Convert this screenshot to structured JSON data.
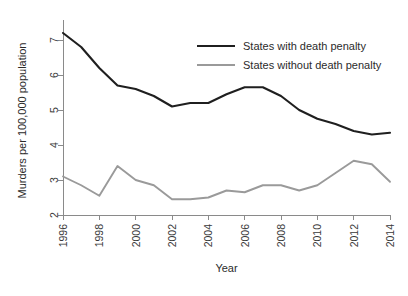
{
  "chart_data": {
    "type": "line",
    "title": "",
    "xlabel": "Year",
    "ylabel": "Murders per 100,000 population",
    "xlim": [
      1996,
      2014
    ],
    "ylim": [
      2,
      7.4
    ],
    "grid": false,
    "legend_position": "top-right",
    "x": [
      1996,
      1997,
      1998,
      1999,
      2000,
      2001,
      2002,
      2003,
      2004,
      2005,
      2006,
      2007,
      2008,
      2009,
      2010,
      2011,
      2012,
      2013,
      2014
    ],
    "xticks": [
      "1996",
      "1998",
      "2000",
      "2002",
      "2004",
      "2006",
      "2008",
      "2010",
      "2012",
      "2014"
    ],
    "xtick_values": [
      1996,
      1998,
      2000,
      2002,
      2004,
      2006,
      2008,
      2010,
      2012,
      2014
    ],
    "yticks": [
      "2",
      "3",
      "4",
      "5",
      "6",
      "7"
    ],
    "ytick_values": [
      2,
      3,
      4,
      5,
      6,
      7
    ],
    "series": [
      {
        "name": "States with death penalty",
        "color": "#1f1f1f",
        "width": 2.1,
        "values": [
          7.2,
          6.8,
          6.2,
          5.7,
          5.6,
          5.4,
          5.1,
          5.2,
          5.2,
          5.45,
          5.65,
          5.65,
          5.4,
          5.0,
          4.75,
          4.6,
          4.4,
          4.3,
          4.35
        ]
      },
      {
        "name": "States without death penalty",
        "color": "#9a9a9a",
        "width": 1.9,
        "values": [
          3.1,
          2.85,
          2.55,
          3.4,
          3.0,
          2.85,
          2.45,
          2.45,
          2.5,
          2.7,
          2.65,
          2.85,
          2.85,
          2.7,
          2.85,
          3.2,
          3.55,
          3.45,
          2.95
        ]
      }
    ]
  },
  "legend": {
    "entries": [
      {
        "label": "States with death penalty"
      },
      {
        "label": "States without death penalty"
      }
    ]
  }
}
